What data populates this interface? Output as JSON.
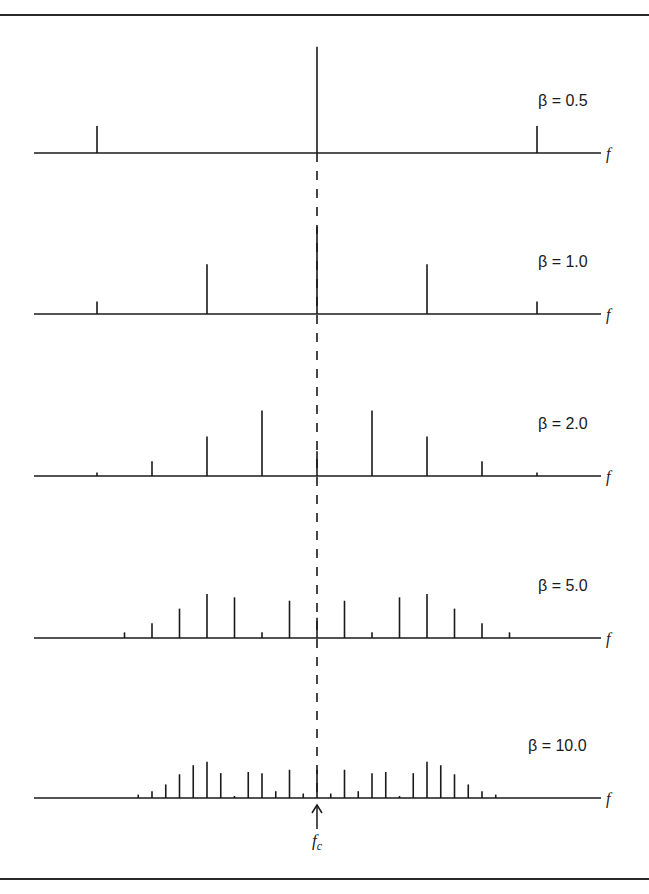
{
  "figure": {
    "top_fragment": "...",
    "axis_label": "f",
    "carrier_label": "f",
    "carrier_subscript": "c",
    "colors": {
      "ink": "#1a1a1a",
      "background": "#ffffff"
    }
  },
  "chart_data": {
    "type": "bar",
    "title": "",
    "xlabel": "f",
    "ylabel": "",
    "grid": false,
    "legend": null,
    "annotations": [
      "f_c (carrier, dashed vertical line with arrow)"
    ],
    "panels": [
      {
        "label": "β = 0.5",
        "beta": 0.5,
        "line_spacing_px": 220,
        "orders": [
          -2,
          -1,
          0,
          1,
          2
        ],
        "amplitudes": [
          0.0,
          0.24,
          0.94,
          0.24,
          0.0
        ]
      },
      {
        "label": "β = 1.0",
        "beta": 1.0,
        "line_spacing_px": 110,
        "orders": [
          -2,
          -1,
          0,
          1,
          2
        ],
        "amplitudes": [
          0.11,
          0.44,
          0.77,
          0.44,
          0.11
        ]
      },
      {
        "label": "β = 2.0",
        "beta": 2.0,
        "line_spacing_px": 55,
        "orders": [
          -4,
          -3,
          -2,
          -1,
          0,
          1,
          2,
          3,
          4
        ],
        "amplitudes": [
          0.03,
          0.13,
          0.35,
          0.58,
          0.22,
          0.58,
          0.35,
          0.13,
          0.03
        ]
      },
      {
        "label": "β = 5.0",
        "beta": 5.0,
        "line_spacing_px": 27.5,
        "orders": [
          -7,
          -6,
          -5,
          -4,
          -3,
          -2,
          -1,
          0,
          1,
          2,
          3,
          4,
          5,
          6,
          7
        ],
        "amplitudes": [
          0.05,
          0.13,
          0.26,
          0.39,
          0.36,
          0.05,
          0.33,
          0.18,
          0.33,
          0.05,
          0.36,
          0.39,
          0.26,
          0.13,
          0.05
        ]
      },
      {
        "label": "β = 10.0",
        "beta": 10.0,
        "line_spacing_px": 13.75,
        "orders": [
          -13,
          -12,
          -11,
          -10,
          -9,
          -8,
          -7,
          -6,
          -5,
          -4,
          -3,
          -2,
          -1,
          0,
          1,
          2,
          3,
          4,
          5,
          6,
          7,
          8,
          9,
          10,
          11,
          12,
          13
        ],
        "amplitudes": [
          0.03,
          0.06,
          0.12,
          0.21,
          0.29,
          0.32,
          0.22,
          0.01,
          0.23,
          0.22,
          0.06,
          0.25,
          0.04,
          0.25,
          0.04,
          0.25,
          0.06,
          0.22,
          0.23,
          0.01,
          0.22,
          0.32,
          0.29,
          0.21,
          0.12,
          0.06,
          0.03
        ]
      }
    ]
  }
}
